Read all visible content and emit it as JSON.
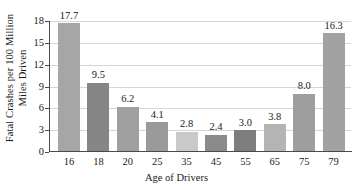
{
  "chart_data": {
    "type": "bar",
    "title": "",
    "xlabel": "Age of Drivers",
    "ylabel_line1": "Fatal Crashes per 100 Million",
    "ylabel_line2": "Miles Driven",
    "categories": [
      "16",
      "18",
      "20",
      "25",
      "35",
      "45",
      "55",
      "65",
      "75",
      "79"
    ],
    "values": [
      17.7,
      9.5,
      6.2,
      4.1,
      2.8,
      2.4,
      3.0,
      3.8,
      8.0,
      16.3
    ],
    "value_labels": [
      "17.7",
      "9.5",
      "6.2",
      "4.1",
      "2.8",
      "2.4",
      "3.0",
      "3.8",
      "8.0",
      "16.3"
    ],
    "bar_colors": [
      "#a6a6a6",
      "#868686",
      "#a0a0a0",
      "#9a9a9a",
      "#c9c9c9",
      "#8a8a8a",
      "#7e7e7e",
      "#b4b4b4",
      "#9e9e9e",
      "#a2a2a2"
    ],
    "ylim": [
      0,
      18
    ],
    "yticks": [
      0,
      3,
      6,
      9,
      12,
      15,
      18
    ],
    "ytick_labels": [
      "0",
      "3",
      "6",
      "9",
      "12",
      "15",
      "18"
    ],
    "grid": true,
    "grid_color": "#d6d6d6",
    "axis_color": "#4a4a4a",
    "legend": "none",
    "background": "#ffffff"
  }
}
